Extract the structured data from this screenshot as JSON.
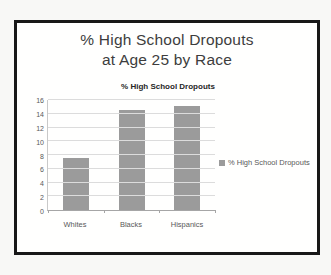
{
  "window": {
    "background": "#f8f8f6",
    "frame_border_color": "#181818"
  },
  "main_title": {
    "line1": "% High School Dropouts",
    "line2": "at Age 25 by Race"
  },
  "chart_data": {
    "type": "bar",
    "title": "% High School Dropouts",
    "categories": [
      "Whites",
      "Blacks",
      "Hispanics"
    ],
    "series": [
      {
        "name": "% High School Dropouts",
        "values": [
          7.5,
          14.5,
          15.1
        ]
      }
    ],
    "xlabel": "",
    "ylabel": "",
    "ylim": [
      0,
      16
    ],
    "yticks": [
      0,
      2,
      4,
      6,
      8,
      10,
      12,
      14,
      16
    ],
    "grid": true,
    "legend_position": "right",
    "bar_color": "#9b9b9b",
    "gridline_color": "#dcdcdc",
    "axis_text_color": "#595959"
  },
  "legend": {
    "label": "% High School Dropouts",
    "marker_color": "#9b9b9b"
  }
}
